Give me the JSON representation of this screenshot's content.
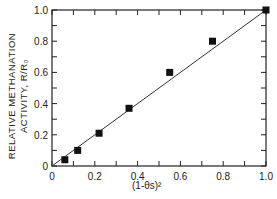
{
  "chart_data": {
    "type": "scatter",
    "title": "",
    "xlabel": "(1-θs)²",
    "ylabel_line1": "RELATIVE METHANATION",
    "ylabel_line2": "ACTIVITY, R/R₀",
    "xlim": [
      0,
      1.0
    ],
    "ylim": [
      0,
      1.0
    ],
    "x_ticks": [
      "0",
      "0.2",
      "0.4",
      "0.6",
      "0.8",
      "1.0"
    ],
    "y_ticks": [
      "0",
      "0.2",
      "0.4",
      "0.6",
      "0.8",
      "1.0"
    ],
    "series": [
      {
        "name": "data",
        "marker": "square",
        "x": [
          0.06,
          0.12,
          0.22,
          0.36,
          0.55,
          0.75,
          1.0
        ],
        "y": [
          0.04,
          0.1,
          0.21,
          0.37,
          0.6,
          0.8,
          1.0
        ]
      },
      {
        "name": "fit",
        "type": "line",
        "x": [
          0,
          1.0
        ],
        "y": [
          0,
          1.0
        ]
      }
    ],
    "grid": false,
    "legend": null
  }
}
